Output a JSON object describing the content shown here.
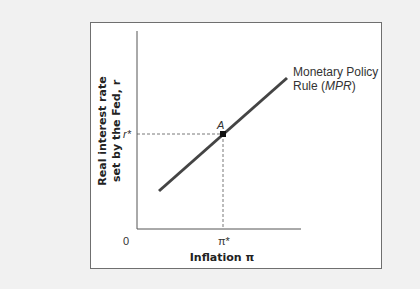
{
  "diagram": {
    "title": "",
    "y_axis_label_line1": "Real interest rate",
    "y_axis_label_line2": "set by the Fed, r",
    "x_axis_label": "Inflation π",
    "origin_label": "0",
    "x_tick_label": "π*",
    "y_tick_label": "r*",
    "point_label": "A",
    "curve_label_line1": "Monetary Policy",
    "curve_label_line2_prefix": "Rule (",
    "curve_label_line2_italic": "MPR",
    "curve_label_line2_suffix": ")",
    "colors": {
      "background": "#f1f1f1",
      "frame": "#ffffff",
      "line": "#444444",
      "axis": "#555555"
    }
  }
}
